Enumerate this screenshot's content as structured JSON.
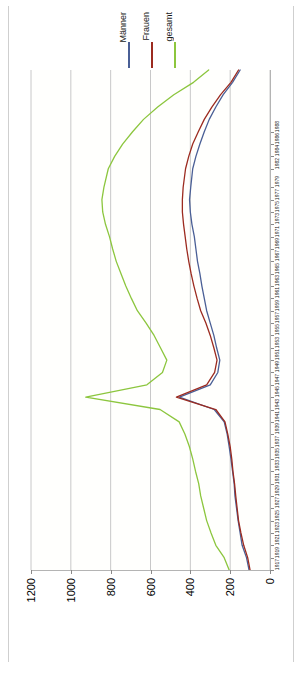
{
  "legend": {
    "position": "top-center",
    "entries": [
      {
        "label": "Männer",
        "color": "#4a5f96"
      },
      {
        "label": "Frauen",
        "color": "#9c2b20"
      },
      {
        "label": "gesamt",
        "color": "#8cc63e"
      }
    ]
  },
  "axes": {
    "value_axis_labels": [
      "1200",
      "1000",
      "800",
      "600",
      "400",
      "200",
      "0"
    ],
    "value_axis_ticks": [
      1200,
      1000,
      800,
      600,
      400,
      200,
      0
    ],
    "value_axis_reversed": true,
    "year_axis_labels": [
      "1917",
      "1919",
      "1921",
      "1923",
      "1925",
      "1927",
      "1929",
      "1931",
      "1933",
      "1935",
      "1937",
      "1939",
      "1941",
      "1943",
      "1945",
      "1947",
      "1949",
      "1951",
      "1953",
      "1955",
      "1957",
      "1959",
      "1961",
      "1963",
      "1965",
      "1967",
      "1969",
      "1971",
      "1973",
      "1975",
      "1977",
      "1979",
      "1982",
      "1984",
      "1986",
      "1988"
    ]
  },
  "chart_data": {
    "type": "line",
    "title": "",
    "xlabel": "",
    "ylabel": "",
    "orientation": "horizontal-values",
    "xlim": [
      0,
      1200
    ],
    "ylim": [
      1917,
      1998
    ],
    "grid": true,
    "legend_position": "top-center",
    "x": [
      1917,
      1919,
      1921,
      1923,
      1925,
      1927,
      1929,
      1931,
      1933,
      1935,
      1937,
      1939,
      1941,
      1943,
      1945,
      1947,
      1949,
      1951,
      1953,
      1955,
      1957,
      1959,
      1961,
      1963,
      1965,
      1967,
      1969,
      1971,
      1973,
      1975,
      1977,
      1979,
      1982,
      1984,
      1986,
      1988,
      1990,
      1992,
      1994,
      1996,
      1998
    ],
    "series": [
      {
        "name": "Männer",
        "color": "#4a5f96",
        "values": [
          105,
          118,
          140,
          150,
          160,
          168,
          176,
          180,
          188,
          196,
          205,
          215,
          230,
          280,
          455,
          300,
          262,
          252,
          268,
          282,
          300,
          318,
          330,
          342,
          352,
          364,
          372,
          380,
          392,
          400,
          404,
          398,
          388,
          372,
          352,
          330,
          305,
          272,
          235,
          188,
          150
        ]
      },
      {
        "name": "Frauen",
        "color": "#9c2b20",
        "values": [
          100,
          112,
          132,
          146,
          158,
          165,
          172,
          178,
          186,
          192,
          200,
          212,
          226,
          272,
          470,
          318,
          278,
          266,
          282,
          300,
          322,
          348,
          366,
          382,
          396,
          408,
          418,
          426,
          434,
          440,
          440,
          436,
          424,
          408,
          388,
          360,
          330,
          292,
          248,
          196,
          158
        ]
      },
      {
        "name": "gesamt",
        "color": "#8cc63e",
        "values": [
          205,
          230,
          272,
          296,
          318,
          333,
          348,
          358,
          374,
          388,
          405,
          427,
          456,
          552,
          925,
          618,
          540,
          518,
          550,
          582,
          622,
          666,
          696,
          724,
          748,
          772,
          790,
          806,
          826,
          840,
          844,
          834,
          812,
          780,
          740,
          690,
          635,
          564,
          483,
          384,
          308
        ]
      }
    ]
  }
}
